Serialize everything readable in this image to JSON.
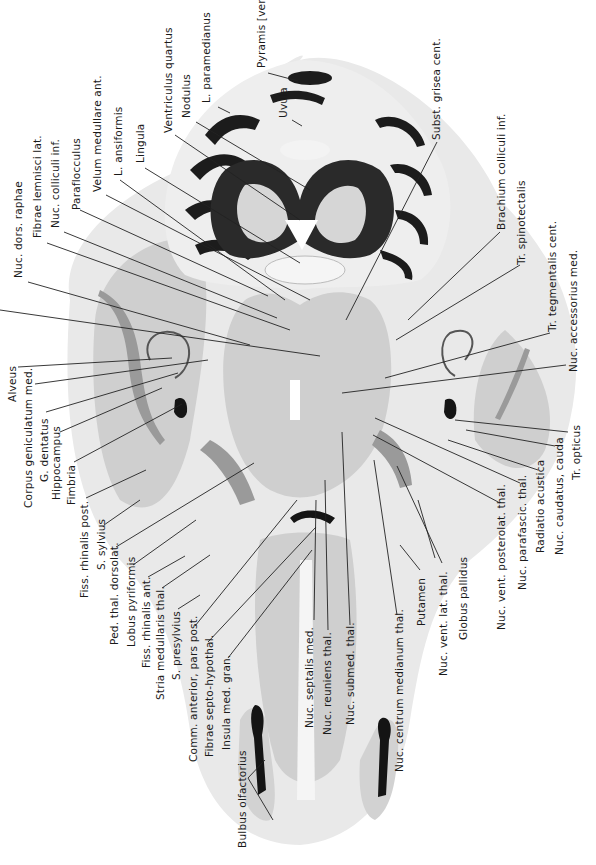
{
  "figure": {
    "type": "anatomical-section",
    "orientation": "labels rotated 90° counter-clockwise",
    "colors": {
      "background": "#ffffff",
      "tissue_light": "#e6e6e6",
      "tissue_mid": "#cfcfcf",
      "cerebellar_folia": "#1c1c1c",
      "label_text": "#1a1a1a",
      "leader_lines": "#222222"
    }
  },
  "labels": {
    "top": [
      {
        "id": "nuc-dors-raphae",
        "text": "Nuc. dors. raphae"
      },
      {
        "id": "fibrae-lemnisci-lat",
        "text": "Fibrae lemnisci lat."
      },
      {
        "id": "nuc-colliculi-inf",
        "text": "Nuc. colliculi inf."
      },
      {
        "id": "paraflocculus",
        "text": "Paraflocculus"
      },
      {
        "id": "velum-medullare-ant",
        "text": "Velum medullare ant."
      },
      {
        "id": "l-ansiformis",
        "text": "L. ansiformis"
      },
      {
        "id": "lingula",
        "text": "Lingula"
      },
      {
        "id": "ventriculus-quartus",
        "text": "Ventriculus quartus"
      },
      {
        "id": "nodulus",
        "text": "Nodulus"
      },
      {
        "id": "l-paramedianus",
        "text": "L. paramedianus"
      },
      {
        "id": "pyramis-vermis",
        "text": "Pyramis [vermis]"
      },
      {
        "id": "uvula",
        "text": "Uvula"
      },
      {
        "id": "subst-grisea-cent",
        "text": "Subst. grisea cent."
      },
      {
        "id": "brachium-colliculi-inf",
        "text": "Brachium colliculi inf."
      },
      {
        "id": "tr-spinotectalis",
        "text": "Tr. spinotectalis"
      }
    ],
    "right": [
      {
        "id": "tr-tegmentalis-cent",
        "text": "Tr. tegmentalis cent."
      },
      {
        "id": "nuc-accessorius-med",
        "text": "Nuc. accessorius med."
      },
      {
        "id": "tr-opticus",
        "text": "Tr. opticus"
      },
      {
        "id": "nuc-caudatus-cauda",
        "text": "Nuc. caudatus, cauda"
      },
      {
        "id": "radiatio-acustica",
        "text": "Radiatio acustica"
      },
      {
        "id": "nuc-parafascic-thal",
        "text": "Nuc. parafascic. thal."
      },
      {
        "id": "nuc-vent-posterolat-thal",
        "text": "Nuc. vent. posterolat. thal."
      },
      {
        "id": "globus-pallidus",
        "text": "Globus pallidus"
      },
      {
        "id": "nuc-vent-lat-thal",
        "text": "Nuc. vent. lat. thal."
      },
      {
        "id": "putamen",
        "text": "Putamen"
      },
      {
        "id": "nuc-centrum-medianum-thal",
        "text": "Nuc. centrum medianum thal."
      }
    ],
    "bottom_center": [
      {
        "id": "nuc-submed-thal",
        "text": "Nuc. submed. thal."
      },
      {
        "id": "nuc-reuniens-thal",
        "text": "Nuc. reuniens thal."
      },
      {
        "id": "nuc-septalis-med",
        "text": "Nuc. septalis med."
      }
    ],
    "left": [
      {
        "id": "alveus",
        "text": "Alveus"
      },
      {
        "id": "corpus-geniculatum-med",
        "text": "Corpus geniculatum med."
      },
      {
        "id": "g-dentatus",
        "text": "G. dentatus"
      },
      {
        "id": "hippocampus",
        "text": "Hippocampus"
      },
      {
        "id": "fimbria",
        "text": "Fimbria"
      },
      {
        "id": "fiss-rhinalis-post",
        "text": "Fiss. rhinalis post."
      },
      {
        "id": "s-sylvius",
        "text": "S. sylvius"
      },
      {
        "id": "ped-thal-dorsolat",
        "text": "Ped. thal. dorsolat."
      },
      {
        "id": "lobus-pyriformis",
        "text": "Lobus pyriformis"
      },
      {
        "id": "fiss-rhinalis-ant",
        "text": "Fiss. rhinalis ant."
      },
      {
        "id": "stria-medullaris-thal",
        "text": "Stria medullaris thal."
      },
      {
        "id": "s-presylvius",
        "text": "S. presylvius"
      },
      {
        "id": "comm-anterior-pars-post",
        "text": "Comm. anterior, pars post."
      },
      {
        "id": "fibrae-septo-hypothal",
        "text": "Fibrae septo-hypothal."
      },
      {
        "id": "insula-med-gran",
        "text": "Insula med. gran."
      },
      {
        "id": "bulbus-olfactorius",
        "text": "Bulbus olfactorius"
      }
    ]
  }
}
